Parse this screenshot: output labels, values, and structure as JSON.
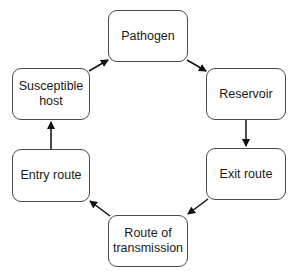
{
  "diagram": {
    "type": "cycle",
    "nodes": [
      {
        "id": "pathogen",
        "label": "Pathogen"
      },
      {
        "id": "reservoir",
        "label": "Reservoir"
      },
      {
        "id": "exit",
        "label": "Exit route"
      },
      {
        "id": "transmission",
        "label": "Route of transmission"
      },
      {
        "id": "entry",
        "label": "Entry route"
      },
      {
        "id": "host",
        "label": "Susceptible host"
      }
    ],
    "edges": [
      {
        "from": "pathogen",
        "to": "reservoir"
      },
      {
        "from": "reservoir",
        "to": "exit"
      },
      {
        "from": "exit",
        "to": "transmission"
      },
      {
        "from": "transmission",
        "to": "entry"
      },
      {
        "from": "entry",
        "to": "host"
      },
      {
        "from": "host",
        "to": "pathogen"
      }
    ],
    "colors": {
      "border": "#4a4a4a",
      "arrow": "#111111",
      "text": "#1a1a1a",
      "background": "#ffffff"
    }
  }
}
